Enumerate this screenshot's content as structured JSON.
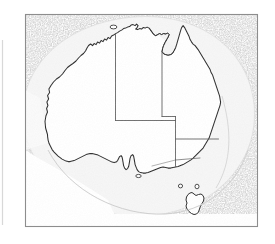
{
  "figure": {
    "name": "map-of-australia",
    "caption": "",
    "width": 275,
    "height": 244
  },
  "frame": {
    "name": "map-frame",
    "x": 25,
    "y": 14,
    "width": 233,
    "height": 213,
    "stroke_color": "#8d8d8d",
    "stroke_width": 1.1,
    "fill_color": "#ffffff"
  },
  "page_edge": {
    "name": "page-edge-line",
    "x": 2.5,
    "y1": 40,
    "y2": 225,
    "color": "#d8d8d8"
  },
  "layers": {
    "deep_ocean": {
      "label": "deep-ocean-stipple",
      "color": "#9a9a9a",
      "texture": "stipple"
    },
    "continental_shelf": {
      "label": "continental-shelf",
      "color": "#f2f2f2"
    },
    "landmass": {
      "label": "australia-landmass",
      "color": "#ffffff",
      "outline_color": "#2b2b2b",
      "outline_width": 1.0
    },
    "state_borders": {
      "label": "state-boundaries",
      "color": "#5a5a5a",
      "width": 0.8
    }
  },
  "geometry": {
    "mainland_outline": "M 47.5 134.5 L 45.5 128.0 L 45.0 121.5 L 45.8 116.0 L 47.5 112.0 L 46.5 108.5 L 47.8 105.5 L 46.8 102.0 L 48.5 99.0 L 47.5 95.5 L 49.5 92.5 L 48.8 89.0 L 51.0 85.5 L 53.5 82.0 L 56.5 79.0 L 59.5 77.0 L 62.5 74.0 L 65.0 70.5 L 67.5 67.5 L 70.0 65.5 L 73.0 63.5 L 76.0 61.0 L 78.5 58.0 L 81.0 55.5 L 83.5 53.5 L 85.5 51.0 L 87.0 48.0 L 88.5 45.5 L 90.5 44.0 L 92.5 45.5 L 94.0 43.5 L 96.0 44.5 L 97.5 42.0 L 99.5 43.0 L 101.0 40.5 L 103.0 41.5 L 104.5 39.0 L 106.5 40.0 L 108.0 37.5 L 110.0 38.5 L 111.5 36.0 L 113.5 35.0 L 115.5 33.5 L 117.5 32.5 L 119.5 31.0 L 121.5 30.0 L 123.5 28.5 L 125.5 28.0 L 127.5 27.0 L 129.5 26.5 L 131.0 25.0 L 133.0 24.5 L 135.0 25.5 L 136.5 24.0 L 138.0 25.5 L 137.0 27.5 L 135.5 29.0 L 137.5 29.5 L 139.5 28.5 L 141.5 29.0 L 143.0 27.5 L 145.0 28.0 L 147.0 27.0 L 149.0 28.0 L 150.5 30.0 L 152.0 32.0 L 153.5 34.0 L 155.5 35.5 L 157.5 34.5 L 159.5 33.5 L 161.5 34.5 L 163.5 33.5 L 165.5 34.0 L 167.5 33.0 L 169.0 34.5 L 168.0 37.0 L 166.5 39.5 L 165.0 42.5 L 163.5 45.5 L 162.5 48.5 L 162.0 51.5 L 163.5 53.5 L 165.5 54.5 L 168.0 55.0 L 170.5 54.5 L 172.5 53.0 L 174.0 50.5 L 175.5 47.5 L 176.5 44.5 L 177.5 41.0 L 178.5 37.5 L 179.5 34.0 L 180.5 30.5 L 181.5 27.5 L 183.0 25.5 L 184.5 27.5 L 186.0 30.5 L 187.5 33.5 L 189.0 36.5 L 190.0 39.5 L 191.5 42.0 L 193.0 44.0 L 195.0 45.5 L 196.5 47.5 L 198.0 49.5 L 199.5 52.0 L 201.0 54.5 L 202.5 57.0 L 204.0 59.5 L 205.5 62.0 L 207.0 64.5 L 208.5 67.0 L 210.0 69.5 L 211.0 72.5 L 212.5 75.0 L 213.5 78.0 L 214.5 81.0 L 215.5 84.0 L 216.5 87.0 L 217.5 90.0 L 218.5 93.0 L 219.5 96.0 L 220.0 99.0 L 220.5 102.0 L 220.0 105.0 L 219.0 108.0 L 218.0 111.0 L 217.0 114.0 L 216.0 117.0 L 215.0 120.0 L 214.0 123.0 L 213.0 126.0 L 212.0 129.0 L 211.0 132.0 L 210.0 135.0 L 209.0 138.0 L 207.5 140.5 L 206.0 143.0 L 204.5 145.5 L 203.0 148.0 L 201.0 150.0 L 199.0 152.0 L 197.0 154.0 L 195.0 156.0 L 193.0 158.0 L 190.5 160.0 L 188.0 161.5 L 185.5 163.0 L 183.0 164.5 L 180.5 165.5 L 178.0 166.5 L 175.5 167.0 L 173.0 167.5 L 170.5 168.0 L 168.0 168.0 L 165.5 167.5 L 163.0 167.0 L 160.5 167.5 L 158.0 168.5 L 155.5 169.5 L 153.0 170.5 L 150.5 171.5 L 148.0 172.5 L 145.5 173.0 L 143.0 173.0 L 140.5 172.5 L 138.5 171.5 L 137.0 169.5 L 136.0 167.0 L 135.0 164.5 L 134.5 161.5 L 134.0 158.5 L 133.5 156.0 L 132.5 154.5 L 131.0 155.5 L 130.0 158.0 L 129.5 161.0 L 129.0 164.0 L 128.5 166.5 L 127.5 168.5 L 126.0 169.5 L 124.5 168.0 L 123.5 165.5 L 123.0 162.5 L 122.5 159.5 L 122.0 157.0 L 121.0 155.5 L 119.5 156.5 L 118.5 158.5 L 117.5 160.5 L 116.0 162.0 L 114.0 162.5 L 112.0 162.0 L 110.0 161.0 L 108.0 160.0 L 106.0 159.0 L 104.0 158.0 L 102.0 157.0 L 100.0 156.0 L 98.0 155.0 L 96.0 154.5 L 94.0 154.0 L 92.0 153.5 L 90.0 153.5 L 88.0 154.0 L 86.0 154.5 L 84.0 155.5 L 82.0 156.5 L 80.0 157.5 L 78.0 158.5 L 76.0 159.5 L 74.0 160.5 L 72.0 161.0 L 70.0 161.5 L 68.0 161.5 L 66.0 161.0 L 64.0 160.0 L 62.0 159.0 L 60.0 157.5 L 58.0 156.0 L 56.0 154.0 L 54.0 152.0 L 52.0 149.5 L 50.5 146.5 L 49.0 143.5 L 48.0 140.0 L 47.5 136.5 Z",
    "tasmania_outline": "M 188.0 194.5 L 186.5 197.0 L 186.0 200.0 L 187.0 203.0 L 186.0 206.0 L 187.0 209.0 L 189.0 211.5 L 191.5 213.5 L 194.0 214.5 L 196.5 214.0 L 198.5 212.0 L 199.5 209.0 L 200.5 206.0 L 202.0 203.5 L 203.5 201.0 L 204.0 198.0 L 203.0 195.5 L 201.0 194.0 L 198.5 194.5 L 196.0 195.5 L 194.0 194.0 L 192.0 192.5 L 190.0 193.0 Z",
    "king_island": "M 180.5 186.0 a 2.1 1.9 0 1 0 0.1 0 Z",
    "flinders_island": "M 197.0 186.5 a 2.0 2.3 0 1 0 0.1 0 Z",
    "kangaroo_island": "M 138.5 176.5 a 2.6 1.6 0 1 0 0.1 0 Z",
    "melville_island": "M 113.5 27.0 a 3.2 1.8 0 1 0 0.1 0 Z",
    "state_border_paths": [
      "M 115.5 33.0 L 115.5 120.5",
      "M 162.0 52.0 L 162.0 116.0",
      "M 115.5 120.5 L 162.0 120.5",
      "M 162.0 116.0 L 175.0 116.0",
      "M 175.0 116.0 L 175.0 165.0",
      "M 175.0 139.0 L 219.0 139.0",
      "M 162.0 120.5 L 175.0 120.5"
    ],
    "deep_ocean_region": "M 25 14 L 258 14 L 258 227 L 25 227 Z",
    "shelf_arc": "M 25 108 C 30 60, 70 24, 132 18 C 196 12, 244 48, 250 104 C 256 160, 212 210, 146 214 C 82 218, 30 172, 25 112 Z"
  },
  "annotations": {
    "background_color": "#ffffff",
    "ocean_note": "stippled grey photocopy texture",
    "land_note": "white interior with hand-drawn coastline"
  }
}
